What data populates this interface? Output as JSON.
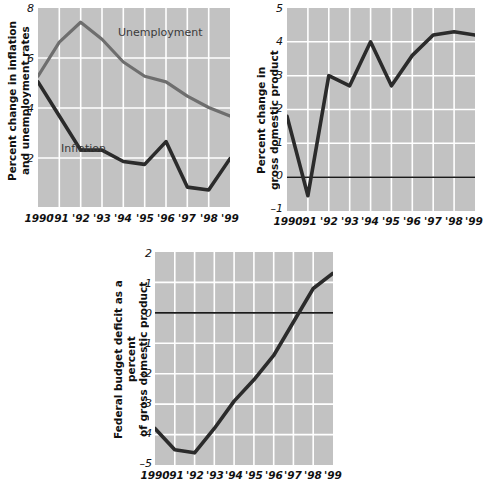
{
  "figure": {
    "background_color": "#ffffff",
    "plot_background_color": "#c2c2c2",
    "gridline_color": "#ffffff",
    "line_color_dark": "#2b2b2b",
    "line_color_gray": "#6e6e6e",
    "zero_line_color": "#1a1a1a"
  },
  "charts": [
    {
      "id": "inflation-unemployment",
      "type": "line",
      "title": "",
      "ylabel": "Percent change in inflation\nand unemployment rates",
      "xlabel": "",
      "ylim": [
        1.0,
        8.0
      ],
      "yticks": [
        8,
        6,
        4,
        2
      ],
      "ytick_labels": [
        "8",
        "6",
        "4",
        "2"
      ],
      "grid": true,
      "legend": "inline-labels",
      "categories": [
        "1990",
        "1991",
        "1992",
        "1993",
        "1994",
        "1995",
        "1996",
        "1997",
        "1998",
        "1999"
      ],
      "xtick_labels": [
        "1990",
        "'91",
        "'92",
        "'93",
        "'94",
        "'95",
        "'96",
        "'97",
        "'98",
        "'99"
      ],
      "series": [
        {
          "name": "Unemployment",
          "label_text": "Unemployment",
          "color": "#6e6e6e",
          "values": [
            5.6,
            6.8,
            7.5,
            6.9,
            6.1,
            5.6,
            5.4,
            4.9,
            4.5,
            4.2
          ]
        },
        {
          "name": "Inflation",
          "label_text": "Inflation",
          "color": "#2b2b2b",
          "values": [
            5.4,
            4.2,
            3.0,
            3.0,
            2.6,
            2.5,
            3.3,
            1.7,
            1.6,
            2.7
          ]
        }
      ]
    },
    {
      "id": "gdp-percent-change",
      "type": "line",
      "title": "",
      "ylabel": "Percent change in\ngross domestic product",
      "xlabel": "",
      "ylim": [
        -1,
        5
      ],
      "yticks": [
        5,
        4,
        3,
        2,
        1,
        0,
        -1
      ],
      "ytick_labels": [
        "5",
        "4",
        "3",
        "2",
        "1",
        "0",
        "–1"
      ],
      "grid": true,
      "zero_line": 0,
      "categories": [
        "1990",
        "1991",
        "1992",
        "1993",
        "1994",
        "1995",
        "1996",
        "1997",
        "1998",
        "1999"
      ],
      "xtick_labels": [
        "1990",
        "'91",
        "'92",
        "'93",
        "'94",
        "'95",
        "'96",
        "'97",
        "'98",
        "'99"
      ],
      "series": [
        {
          "name": "Percent change in gross domestic product",
          "color": "#2b2b2b",
          "values": [
            1.8,
            -0.55,
            3.0,
            2.7,
            4.0,
            2.7,
            3.6,
            4.2,
            4.3,
            4.2
          ]
        }
      ]
    },
    {
      "id": "federal-budget-deficit",
      "type": "line",
      "title": "",
      "ylabel": "Federal budget deficit as a percent\nof gross domestic product",
      "xlabel": "",
      "ylim": [
        -5,
        2
      ],
      "yticks": [
        2,
        1,
        0,
        -1,
        -2,
        -3,
        -4,
        -5
      ],
      "ytick_labels": [
        "2",
        "1",
        "0",
        "–1",
        "–2",
        "–3",
        "–4",
        "–5"
      ],
      "grid": true,
      "zero_line": 0,
      "categories": [
        "1990",
        "1991",
        "1992",
        "1993",
        "1994",
        "1995",
        "1996",
        "1997",
        "1998",
        "1999"
      ],
      "xtick_labels": [
        "1990",
        "'91",
        "'92",
        "'93",
        "'94",
        "'95",
        "'96",
        "'97",
        "'98",
        "'99"
      ],
      "series": [
        {
          "name": "Federal budget deficit as a percent of gross domestic product",
          "color": "#2b2b2b",
          "values": [
            -3.8,
            -4.5,
            -4.6,
            -3.8,
            -2.9,
            -2.2,
            -1.4,
            -0.3,
            0.8,
            1.3
          ]
        }
      ]
    }
  ]
}
